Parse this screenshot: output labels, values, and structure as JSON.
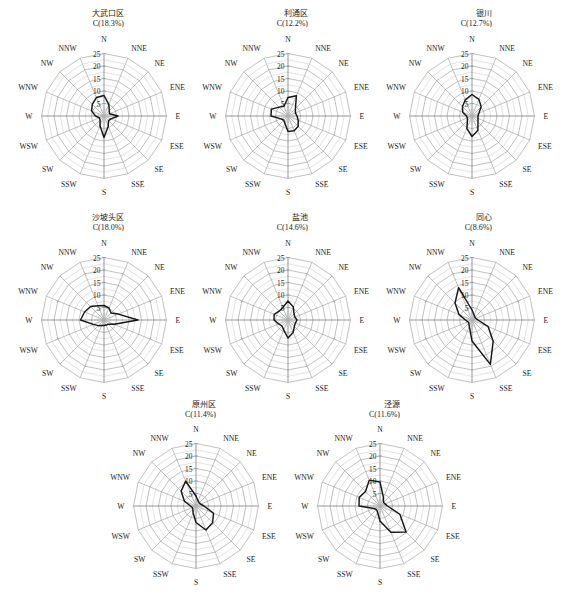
{
  "figure": {
    "kind": "wind-rose-small-multiples",
    "panel_count": 8,
    "radial_ticks": [
      "5",
      "10",
      "15",
      "20",
      "25"
    ],
    "radial_tick_values": [
      5,
      10,
      15,
      20,
      25
    ],
    "radial_max": 25,
    "directions": [
      "N",
      "NNE",
      "NE",
      "ENE",
      "E",
      "ESE",
      "SE",
      "SSE",
      "S",
      "SSW",
      "SW",
      "WSW",
      "W",
      "WNW",
      "NW",
      "NNW"
    ],
    "grid": "polar-spider-16-spokes-5-rings",
    "units": "percent frequency",
    "colors": {
      "background": "#ffffff",
      "grid": "#8d8d8d",
      "data_line": "#161616",
      "text": "#1b1b1b"
    }
  },
  "chart_data": [
    {
      "type": "line",
      "title": "大武口区",
      "calm_label": "C(18.3%)",
      "calm_percent": 18.3,
      "categories": [
        "N",
        "NNE",
        "NE",
        "ENE",
        "E",
        "ESE",
        "SE",
        "SSE",
        "S",
        "SSW",
        "SW",
        "WSW",
        "W",
        "WNW",
        "NW",
        "NNW"
      ],
      "values": [
        8.2,
        5.0,
        3.0,
        2.4,
        5.6,
        3.0,
        2.6,
        4.4,
        8.6,
        4.2,
        2.2,
        2.0,
        3.4,
        5.4,
        6.6,
        8.0
      ],
      "ylim": [
        0,
        25
      ],
      "ylabel": "frequency (%)",
      "grid": true
    },
    {
      "type": "line",
      "title": "利通区",
      "calm_label": "C(12.2%)",
      "calm_percent": 12.2,
      "categories": [
        "N",
        "NNE",
        "NE",
        "ENE",
        "E",
        "ESE",
        "SE",
        "SSE",
        "S",
        "SSW",
        "SW",
        "WSW",
        "W",
        "WNW",
        "NW",
        "NNW"
      ],
      "values": [
        7.4,
        8.8,
        4.2,
        3.2,
        3.6,
        4.4,
        5.8,
        6.4,
        6.2,
        3.2,
        2.4,
        3.0,
        6.8,
        7.2,
        5.0,
        4.2
      ],
      "ylim": [
        0,
        25
      ],
      "ylabel": "frequency (%)",
      "grid": true
    },
    {
      "type": "line",
      "title": "银川",
      "calm_label": "C(12.7%)",
      "calm_percent": 12.7,
      "categories": [
        "N",
        "NNE",
        "NE",
        "ENE",
        "E",
        "ESE",
        "SE",
        "SSE",
        "S",
        "SSW",
        "SW",
        "WSW",
        "W",
        "WNW",
        "NW",
        "NNW"
      ],
      "values": [
        8.6,
        7.2,
        5.2,
        3.0,
        2.4,
        2.6,
        3.4,
        6.2,
        8.2,
        5.4,
        2.6,
        2.0,
        2.2,
        4.0,
        5.4,
        7.0
      ],
      "ylim": [
        0,
        25
      ],
      "ylabel": "frequency (%)",
      "grid": true
    },
    {
      "type": "line",
      "title": "沙坡头区",
      "calm_label": "C(18.0%)",
      "calm_percent": 18.0,
      "categories": [
        "N",
        "NNE",
        "NE",
        "ENE",
        "E",
        "ESE",
        "SE",
        "SSE",
        "S",
        "SSW",
        "SW",
        "WSW",
        "W",
        "WNW",
        "NW",
        "NNW"
      ],
      "values": [
        5.8,
        5.2,
        4.0,
        6.2,
        13.6,
        4.4,
        2.4,
        2.2,
        2.2,
        2.4,
        3.2,
        4.6,
        9.4,
        8.4,
        7.6,
        6.2
      ],
      "ylim": [
        0,
        25
      ],
      "ylabel": "frequency (%)",
      "grid": true
    },
    {
      "type": "line",
      "title": "盐池",
      "calm_label": "C(14.6%)",
      "calm_percent": 14.6,
      "categories": [
        "N",
        "NNE",
        "NE",
        "ENE",
        "E",
        "ESE",
        "SE",
        "SSE",
        "S",
        "SSW",
        "SW",
        "WSW",
        "W",
        "WNW",
        "NW",
        "NNW"
      ],
      "values": [
        7.6,
        5.6,
        3.4,
        3.0,
        3.6,
        3.2,
        3.6,
        5.4,
        7.2,
        4.4,
        3.4,
        4.0,
        5.6,
        6.0,
        5.0,
        5.4
      ],
      "ylim": [
        0,
        25
      ],
      "ylabel": "frequency (%)",
      "grid": true
    },
    {
      "type": "line",
      "title": "同心",
      "calm_label": "C(8.6%)",
      "calm_percent": 8.6,
      "categories": [
        "N",
        "NNE",
        "NE",
        "ENE",
        "E",
        "ESE",
        "SE",
        "SSE",
        "S",
        "SSW",
        "SW",
        "WSW",
        "W",
        "WNW",
        "NW",
        "NNW"
      ],
      "values": [
        4.0,
        2.2,
        1.6,
        1.6,
        2.4,
        7.0,
        12.0,
        19.2,
        8.4,
        2.8,
        1.8,
        1.8,
        2.6,
        5.6,
        9.6,
        14.0
      ],
      "ylim": [
        0,
        25
      ],
      "ylabel": "frequency (%)",
      "grid": true
    },
    {
      "type": "line",
      "title": "原州区",
      "calm_label": "C(11.4%)",
      "calm_percent": 11.4,
      "categories": [
        "N",
        "NNE",
        "NE",
        "ENE",
        "E",
        "ESE",
        "SE",
        "SSE",
        "S",
        "SSW",
        "SW",
        "WSW",
        "W",
        "WNW",
        "NW",
        "NNW"
      ],
      "values": [
        4.0,
        2.2,
        1.8,
        2.0,
        3.2,
        7.6,
        9.4,
        10.4,
        6.6,
        3.0,
        1.8,
        1.6,
        2.2,
        5.0,
        8.4,
        10.8
      ],
      "ylim": [
        0,
        25
      ],
      "ylabel": "frequency (%)",
      "grid": true
    },
    {
      "type": "line",
      "title": "泾源",
      "calm_label": "C(11.6%)",
      "calm_percent": 11.6,
      "categories": [
        "N",
        "NNE",
        "NE",
        "ENE",
        "E",
        "ESE",
        "SE",
        "SSE",
        "S",
        "SSW",
        "SW",
        "WSW",
        "W",
        "WNW",
        "NW",
        "NNW"
      ],
      "values": [
        9.6,
        3.6,
        2.0,
        2.2,
        3.0,
        8.6,
        14.8,
        11.4,
        6.0,
        2.6,
        2.0,
        2.6,
        8.4,
        9.0,
        8.2,
        11.2
      ],
      "ylim": [
        0,
        25
      ],
      "ylabel": "frequency (%)",
      "grid": true
    }
  ],
  "layout": {
    "panels": [
      {
        "x": 16,
        "y": 28,
        "size": 176,
        "title_x": 100,
        "title_y": 9,
        "row": 0,
        "col": 0
      },
      {
        "x": 200,
        "y": 28,
        "size": 176,
        "title_x": 284,
        "title_y": 9,
        "row": 0,
        "col": 1
      },
      {
        "x": 384,
        "y": 28,
        "size": 176,
        "title_x": 468,
        "title_y": 9,
        "row": 0,
        "col": 2
      },
      {
        "x": 16,
        "y": 232,
        "size": 176,
        "title_x": 100,
        "title_y": 213,
        "row": 1,
        "col": 0
      },
      {
        "x": 200,
        "y": 232,
        "size": 176,
        "title_x": 284,
        "title_y": 213,
        "row": 1,
        "col": 1
      },
      {
        "x": 384,
        "y": 232,
        "size": 176,
        "title_x": 468,
        "title_y": 213,
        "row": 1,
        "col": 2
      },
      {
        "x": 108,
        "y": 418,
        "size": 176,
        "title_x": 192,
        "title_y": 400,
        "row": 2,
        "col": 0
      },
      {
        "x": 292,
        "y": 418,
        "size": 176,
        "title_x": 376,
        "title_y": 400,
        "row": 2,
        "col": 1
      }
    ]
  }
}
